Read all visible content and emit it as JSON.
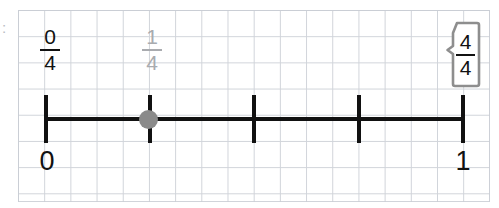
{
  "activity": {
    "type": "fraction-number-line",
    "grid_background": "graph-paper",
    "grid_color": "#c9cdd4"
  },
  "number_line": {
    "start_label": "0",
    "end_label": "1",
    "line_color": "#111111",
    "denominator": 4,
    "tick_count": 5,
    "ticks": [
      {
        "index": 0,
        "fraction": "0/4",
        "x": 44
      },
      {
        "index": 1,
        "fraction": "1/4",
        "x": 148
      },
      {
        "index": 2,
        "fraction": "2/4",
        "x": 252
      },
      {
        "index": 3,
        "fraction": "3/4",
        "x": 357
      },
      {
        "index": 4,
        "fraction": "4/4",
        "x": 461
      }
    ]
  },
  "marker": {
    "name": "point-marker",
    "color": "#8a8a8a",
    "at_fraction": "1/4",
    "x": 148
  },
  "labels": [
    {
      "id": "label-0-4",
      "numerator": "0",
      "denominator": "4",
      "state": "placed",
      "color": "#111111",
      "x": 30
    },
    {
      "id": "label-1-4",
      "numerator": "1",
      "denominator": "4",
      "state": "ghost",
      "color": "#a9abaf",
      "x": 132
    }
  ],
  "endpoints": [
    {
      "id": "endpoint-zero",
      "text": "0",
      "x": 27
    },
    {
      "id": "endpoint-one",
      "text": "1",
      "x": 443
    }
  ],
  "tag": {
    "id": "fraction-tag-4-4",
    "numerator": "4",
    "denominator": "4",
    "border_color": "#8e8e8e",
    "fill_color": "#ffffff"
  },
  "edge_artifact": {
    "glyph": ":",
    "color": "#b9bcc2"
  }
}
